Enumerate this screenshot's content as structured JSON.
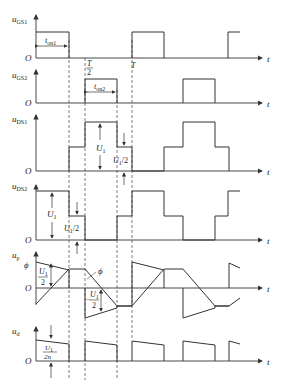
{
  "diagram": {
    "title": "",
    "axis_variable": "t",
    "origin_label": "O",
    "period_label": "T",
    "half_period_label": "T/2",
    "panels": [
      {
        "id": "ugs1",
        "ylabel": "u",
        "ylabel_sub": "GS1",
        "annotation": "t",
        "annotation_sub": "on1"
      },
      {
        "id": "ugs2",
        "ylabel": "u",
        "ylabel_sub": "GS2",
        "annotation": "t",
        "annotation_sub": "on2"
      },
      {
        "id": "uds1",
        "ylabel": "u",
        "ylabel_sub": "DS1",
        "level_full": "U1",
        "level_half": "U1/2"
      },
      {
        "id": "uds2",
        "ylabel": "u",
        "ylabel_sub": "DS2",
        "level_full": "U1",
        "level_half": "U1/2"
      },
      {
        "id": "up",
        "ylabel": "u",
        "ylabel_sub": "p",
        "flux_label": "ϕ",
        "flux_label_curve": "ϕ",
        "level_pos": "U1/2",
        "level_neg": "-U1/2"
      },
      {
        "id": "ud",
        "ylabel": "u",
        "ylabel_sub": "d",
        "level": "U1/(2n)"
      }
    ],
    "labels": {
      "t": "t",
      "O": "O",
      "T": "T",
      "T_num": "T",
      "two": "2",
      "U": "U",
      "one": "1",
      "half_suffix": "/2",
      "n2": "2n",
      "phi": "ϕ",
      "ugs1_sub": "GS1",
      "ugs2_sub": "GS2",
      "uds1_sub": "DS1",
      "uds2_sub": "DS2",
      "up_sub": "p",
      "ud_sub": "d",
      "u": "u",
      "on1": "on1",
      "on2": "on2",
      "minus": "−"
    }
  }
}
